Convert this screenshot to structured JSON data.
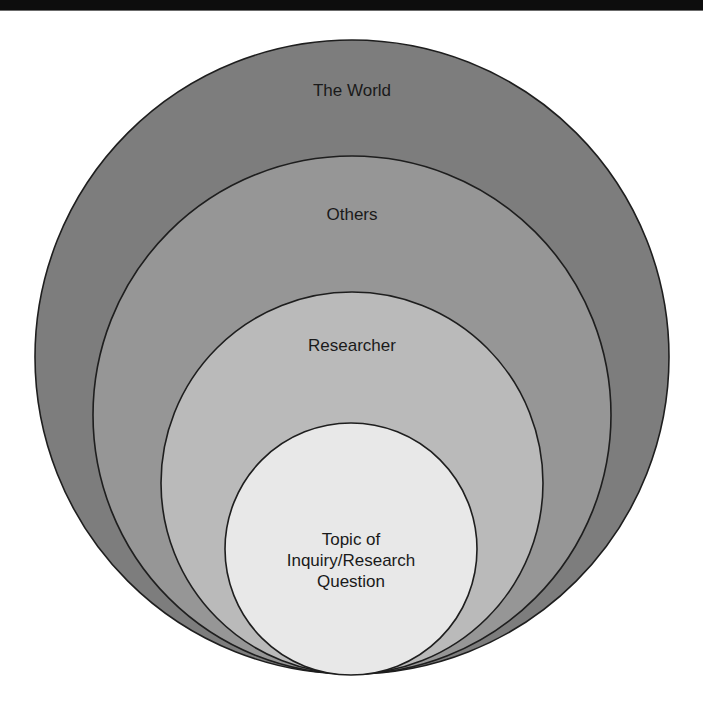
{
  "header": {
    "bar_color": "#0d0d0d"
  },
  "diagram": {
    "type": "nested-circles",
    "background": "#ffffff",
    "stroke_color": "#1e1e1e",
    "circles": [
      {
        "label": "The World",
        "fill": "#7d7d7d",
        "cx": 352,
        "cy": 357,
        "r": 317
      },
      {
        "label": "Others",
        "fill": "#969696",
        "cx": 352,
        "cy": 415,
        "r": 259
      },
      {
        "label": "Researcher",
        "fill": "#bababa",
        "cx": 352,
        "cy": 483,
        "r": 191
      },
      {
        "label": "Topic of\nInquiry/Research\nQuestion",
        "fill": "#e8e8e8",
        "cx": 351,
        "cy": 549,
        "r": 126
      }
    ]
  }
}
